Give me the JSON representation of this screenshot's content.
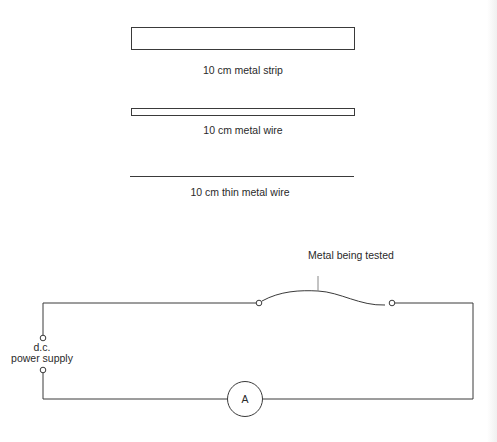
{
  "samples": [
    {
      "label": "10 cm metal strip",
      "shape": "wide-rectangle"
    },
    {
      "label": "10 cm metal wire",
      "shape": "narrow-rectangle"
    },
    {
      "label": "10 cm thin metal wire",
      "shape": "line"
    }
  ],
  "circuit": {
    "test_label": "Metal being tested",
    "supply_line1": "d.c.",
    "supply_line2": "power supply",
    "ammeter_symbol": "A"
  },
  "colors": {
    "stroke": "#3a3a3a",
    "text": "#2a2a2a",
    "background": "#ffffff"
  }
}
